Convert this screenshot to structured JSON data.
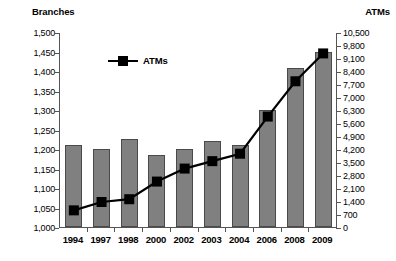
{
  "chart_data": {
    "type": "bar",
    "title": "",
    "categories": [
      "1994",
      "1997",
      "1998",
      "2000",
      "2002",
      "2003",
      "2004",
      "2006",
      "2008",
      "2009"
    ],
    "grid": false,
    "legend_position": "inside-top-left",
    "series": [
      {
        "name": "Branches",
        "type": "bar",
        "axis": "left",
        "values": [
          1210,
          1199,
          1225,
          1185,
          1199,
          1220,
          1210,
          1300,
          1408,
          1450
        ],
        "color": "#808080"
      },
      {
        "name": "ATMs",
        "type": "line",
        "axis": "right",
        "values": [
          950,
          1400,
          1550,
          2500,
          3200,
          3600,
          4000,
          6000,
          7900,
          9400
        ],
        "color": "#000000",
        "marker": "square"
      }
    ],
    "xlabel": "",
    "left_axis": {
      "label": "Branches",
      "ylim": [
        1000,
        1500
      ],
      "tick_step": 50,
      "ticks": [
        "1,000",
        "1,050",
        "1,100",
        "1,150",
        "1,200",
        "1,250",
        "1,300",
        "1,350",
        "1,400",
        "1,450",
        "1,500"
      ],
      "tick_values": [
        1000,
        1050,
        1100,
        1150,
        1200,
        1250,
        1300,
        1350,
        1400,
        1450,
        1500
      ]
    },
    "right_axis": {
      "label": "ATMs",
      "ylim": [
        0,
        10500
      ],
      "tick_step": 700,
      "ticks": [
        "0",
        "700",
        "1,400",
        "2,100",
        "2,800",
        "3,500",
        "4,200",
        "4,900",
        "5,600",
        "6,300",
        "7,000",
        "7,700",
        "8,400",
        "9,100",
        "9,800",
        "10,500"
      ],
      "tick_values": [
        0,
        700,
        1400,
        2100,
        2800,
        3500,
        4200,
        4900,
        5600,
        6300,
        7000,
        7700,
        8400,
        9100,
        9800,
        10500
      ]
    },
    "legend": [
      {
        "label": "ATMs",
        "marker": "square-line",
        "color": "#000000"
      }
    ]
  }
}
